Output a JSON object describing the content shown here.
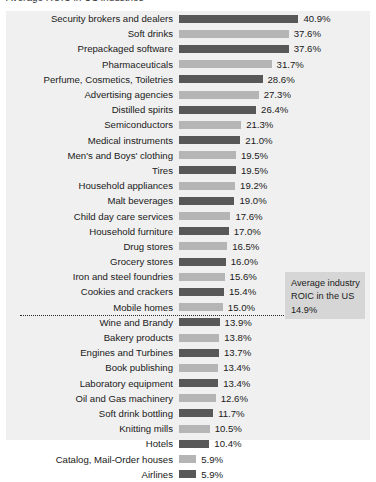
{
  "title_partial": "Average ROIC in US industries",
  "chart_data": {
    "type": "bar",
    "orientation": "horizontal",
    "title": "Average ROIC in US industries",
    "xlabel": "",
    "ylabel": "",
    "xlim": [
      0,
      41
    ],
    "grid": false,
    "legend": null,
    "value_suffix": "%",
    "categories": [
      "Security brokers and dealers",
      "Soft drinks",
      "Prepackaged software",
      "Pharmaceuticals",
      "Perfume, Cosmetics, Toiletries",
      "Advertising agencies",
      "Distilled spirits",
      "Semiconductors",
      "Medical instruments",
      "Men's and Boys' clothing",
      "Tires",
      "Household appliances",
      "Malt beverages",
      "Child day care services",
      "Household furniture",
      "Drug stores",
      "Grocery stores",
      "Iron and steel foundries",
      "Cookies and crackers",
      "Mobile homes",
      "Wine and Brandy",
      "Bakery products",
      "Engines and Turbines",
      "Book publishing",
      "Laboratory equipment",
      "Oil and Gas machinery",
      "Soft drink bottling",
      "Knitting mills",
      "Hotels",
      "Catalog, Mail-Order houses",
      "Airlines"
    ],
    "values": [
      40.9,
      37.6,
      37.6,
      31.7,
      28.6,
      27.3,
      26.4,
      21.3,
      21.0,
      19.5,
      19.5,
      19.2,
      19.0,
      17.6,
      17.0,
      16.5,
      16.0,
      15.6,
      15.4,
      15.0,
      13.9,
      13.8,
      13.7,
      13.4,
      13.4,
      12.6,
      11.7,
      10.5,
      10.4,
      5.9,
      5.9
    ],
    "value_labels": [
      "40.9%",
      "37.6%",
      "37.6%",
      "31.7%",
      "28.6%",
      "27.3%",
      "26.4%",
      "21.3%",
      "21.0%",
      "19.5%",
      "19.5%",
      "19.2%",
      "19.0%",
      "17.6%",
      "17.0%",
      "16.5%",
      "16.0%",
      "15.6%",
      "15.4%",
      "15.0%",
      "13.9%",
      "13.8%",
      "13.7%",
      "13.4%",
      "13.4%",
      "12.6%",
      "11.7%",
      "10.5%",
      "10.4%",
      "5.9%",
      "5.9%"
    ],
    "annotations": [
      {
        "type": "reference-line",
        "value": 14.9,
        "style": "dotted",
        "after_category_index": 19,
        "label_line_1": "Average industry",
        "label_line_2": "ROIC in the US",
        "label_line_3": "14.9%"
      }
    ],
    "colors": {
      "bar_dark": "#585858",
      "bar_light": "#b5b5b5",
      "panel_background": "#f0f0f0",
      "callout_background": "#d6d6d6",
      "text": "#1a1a1a",
      "reference_line": "#2b2b2b"
    }
  },
  "callout": {
    "line1": "Average industry",
    "line2": "ROIC in the US",
    "line3": "14.9%"
  }
}
